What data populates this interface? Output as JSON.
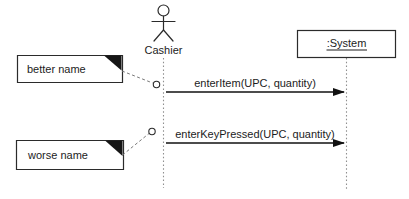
{
  "actor": {
    "label": "Cashier"
  },
  "system": {
    "label": ":System"
  },
  "messages": [
    {
      "label": "enterItem(UPC, quantity)"
    },
    {
      "label": "enterKeyPressed(UPC, quantity)"
    }
  ],
  "notes": [
    {
      "label": "better name"
    },
    {
      "label": "worse name"
    }
  ],
  "colors": {
    "stroke": "#2b2b2b",
    "lifeline": "#8f8f8f",
    "connector": "#7a7a7a",
    "fold": "#161616",
    "arrow": "#111111",
    "text": "#1c1c1c",
    "background": "#ffffff"
  }
}
